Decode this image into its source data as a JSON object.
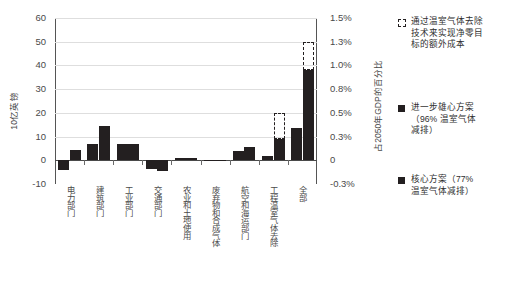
{
  "chart_data": {
    "type": "bar",
    "title": "",
    "subtitle": "",
    "ylabel": "10亿英镑",
    "y2label": "占2050年GDP的百分比",
    "xlabel": "",
    "ylim": [
      -10,
      60
    ],
    "y2lim": [
      -0.3,
      1.5
    ],
    "grid": true,
    "legend_position": "right",
    "categories": [
      "电力部门",
      "建筑部门",
      "工业部门",
      "交通部门",
      "农业和土地使用",
      "废弃物和合成气体",
      "航空和海运部门",
      "工程温室气体去除",
      "全部"
    ],
    "y_tick_labels": [
      "60",
      "50",
      "40",
      "30",
      "20",
      "10",
      "0",
      "-10"
    ],
    "y_tick_values": [
      60,
      50,
      40,
      30,
      20,
      10,
      0,
      -10
    ],
    "y2_tick_labels": [
      "1.5%",
      "1.3%",
      "1.0%",
      "0.8%",
      "0.5%",
      "0.3%",
      "0",
      "-0.3%"
    ],
    "y2_tick_values": [
      1.5,
      1.3,
      1.0,
      0.8,
      0.5,
      0.3,
      0,
      -0.3
    ],
    "series": [
      {
        "name": "核心方案（77% 温室气体减排）",
        "style": "solid",
        "color": "#231f20",
        "values": [
          -4.0,
          7.0,
          7.0,
          -3.5,
          0.8,
          -0.5,
          3.8,
          2.0,
          13.5
        ]
      },
      {
        "name": "进一步雄心方案（96% 温室气体减排）",
        "style": "solid",
        "color": "#231f20",
        "values": [
          4.5,
          14.5,
          7.0,
          -4.5,
          1.0,
          -0.5,
          5.5,
          9.0,
          38.0
        ]
      },
      {
        "name": "通过温室气体去除技术来实现净零目标的额外成本",
        "style": "dashed",
        "color": "#231f20",
        "values": [
          null,
          null,
          null,
          null,
          null,
          null,
          null,
          20.0,
          50.0
        ],
        "bases": [
          null,
          null,
          null,
          null,
          null,
          null,
          null,
          9.0,
          38.0
        ]
      }
    ],
    "legend": [
      {
        "label": "通过温室气体去除技术来实现净零目标的额外成本",
        "lines": [
          "通过温室气体去除",
          "技术来实现净零目",
          "标的额外成本"
        ],
        "swatch": "dashed",
        "color": "#231f20"
      },
      {
        "label": "进一步雄心方案（96% 温室气体减排）",
        "lines": [
          "进一步雄心方案",
          "（96% 温室气体",
          "减排）"
        ],
        "swatch": "solid",
        "color": "#231f20"
      },
      {
        "label": "核心方案（77% 温室气体减排）",
        "lines": [
          "核心方案（77%",
          "温室气体减排）"
        ],
        "swatch": "solid",
        "color": "#231f20"
      }
    ]
  }
}
